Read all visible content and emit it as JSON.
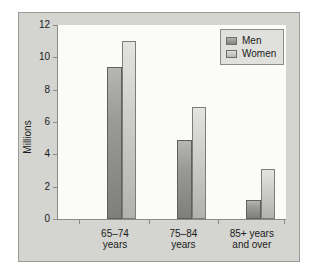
{
  "chart_data": {
    "type": "bar",
    "title": "",
    "xlabel": "",
    "ylabel": "Millions",
    "ylim": [
      0,
      12
    ],
    "yticks": [
      0,
      2,
      4,
      6,
      8,
      10,
      12
    ],
    "ytick_labels": [
      "0",
      "2",
      "4",
      "6",
      "8",
      "10",
      "12"
    ],
    "grid": false,
    "legend_position": "top-right",
    "categories": [
      "65–74\nyears",
      "75–84\nyears",
      "85+ years\nand over"
    ],
    "category_lines": [
      [
        "65–74",
        "years"
      ],
      [
        "75–84",
        "years"
      ],
      [
        "85+ years",
        "and over"
      ]
    ],
    "series": [
      {
        "name": "Men",
        "color": "#8f8f8b",
        "values": [
          9.4,
          4.9,
          1.2
        ]
      },
      {
        "name": "Women",
        "color": "#cbcbc7",
        "values": [
          11.0,
          6.9,
          3.1
        ]
      }
    ]
  },
  "legend": {
    "entries": [
      {
        "label": "Men"
      },
      {
        "label": "Women"
      }
    ]
  },
  "colors": {
    "figure_background": "#d4d4d0",
    "plot_background": "#fbfbfa",
    "axis": "#8a8a86",
    "text": "#1a1a1a"
  }
}
